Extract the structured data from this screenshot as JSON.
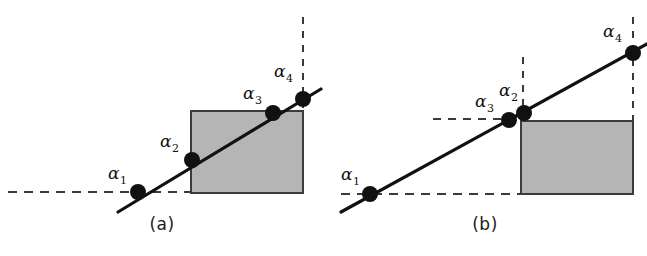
{
  "figure": {
    "title": "",
    "background_color": "#ffffff",
    "width": 647,
    "height": 256
  },
  "style": {
    "line_color": "#111111",
    "dash_color": "#3a3a3a",
    "rect_fill": "#b5b5b5",
    "rect_stroke": "#3c3c3c",
    "point_color": "#111111",
    "text_color": "#111111"
  },
  "panels": [
    {
      "id": "a",
      "caption": "(a)",
      "alpha_symbol": "α",
      "rectangle": {
        "x": 191,
        "y": 111,
        "width": 112,
        "height": 82,
        "fill": "#b5b5b5"
      },
      "solid_line": {
        "x1": 118,
        "y1": 212,
        "x2": 321,
        "y2": 89
      },
      "dashed_horizontal": {
        "x1": 8,
        "y1": 192,
        "x2": 192,
        "y2": 192
      },
      "dashed_vertical": {
        "x1": 303,
        "y1": 17,
        "x2": 303,
        "y2": 112
      },
      "points": [
        {
          "name": "alpha-1",
          "symbol": "α",
          "subscript": "1",
          "x": 138,
          "y": 192,
          "label_x": 108,
          "label_y": 165
        },
        {
          "name": "alpha-2",
          "symbol": "α",
          "subscript": "2",
          "x": 192,
          "y": 160,
          "label_x": 160,
          "label_y": 133
        },
        {
          "name": "alpha-3",
          "symbol": "α",
          "subscript": "3",
          "x": 273,
          "y": 113,
          "label_x": 243,
          "label_y": 85
        },
        {
          "name": "alpha-4",
          "symbol": "α",
          "subscript": "4",
          "x": 303,
          "y": 99,
          "label_x": 274,
          "label_y": 63
        }
      ]
    },
    {
      "id": "b",
      "caption": "(b)",
      "alpha_symbol": "α",
      "rectangle": {
        "x": 198,
        "y": 121,
        "width": 112,
        "height": 73,
        "fill": "#b5b5b5"
      },
      "solid_line": {
        "x1": 18,
        "y1": 212,
        "x2": 324,
        "y2": 44
      },
      "dashed_horizontal_lower": {
        "x1": 18,
        "y1": 194,
        "x2": 198,
        "y2": 194
      },
      "dashed_horizontal_upper": {
        "x1": 110,
        "y1": 119,
        "x2": 196,
        "y2": 119
      },
      "dashed_vertical_mid": {
        "x1": 200,
        "y1": 57,
        "x2": 200,
        "y2": 121
      },
      "dashed_vertical_right": {
        "x1": 310,
        "y1": 17,
        "x2": 310,
        "y2": 122
      },
      "points": [
        {
          "name": "alpha-1",
          "symbol": "α",
          "subscript": "1",
          "x": 47,
          "y": 194,
          "label_x": 18,
          "label_y": 166
        },
        {
          "name": "alpha-3",
          "symbol": "α",
          "subscript": "3",
          "x": 186,
          "y": 120,
          "label_x": 152,
          "label_y": 93
        },
        {
          "name": "alpha-2",
          "symbol": "α",
          "subscript": "2",
          "x": 201,
          "y": 113,
          "label_x": 176,
          "label_y": 82
        },
        {
          "name": "alpha-4",
          "symbol": "α",
          "subscript": "4",
          "x": 310,
          "y": 53,
          "label_x": 280,
          "label_y": 23
        }
      ]
    }
  ]
}
